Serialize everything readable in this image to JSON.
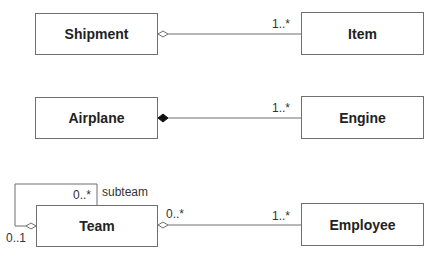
{
  "classes": {
    "shipment": "Shipment",
    "item": "Item",
    "airplane": "Airplane",
    "engine": "Engine",
    "team": "Team",
    "employee": "Employee"
  },
  "associations": [
    {
      "from": "Shipment",
      "to": "Item",
      "type": "aggregation",
      "target_multiplicity": "1..*"
    },
    {
      "from": "Airplane",
      "to": "Engine",
      "type": "composition",
      "target_multiplicity": "1..*"
    },
    {
      "from": "Team",
      "to": "Employee",
      "type": "aggregation",
      "source_multiplicity": "0..*",
      "target_multiplicity": "1..*"
    },
    {
      "from": "Team",
      "to": "Team",
      "type": "aggregation",
      "role": "subteam",
      "source_multiplicity": "0..1",
      "target_multiplicity": "0..*"
    }
  ],
  "labels": {
    "shipment_item_mult": "1..*",
    "airplane_engine_mult": "1..*",
    "team_employee_src_mult": "0..*",
    "team_employee_tgt_mult": "1..*",
    "subteam_role": "subteam",
    "subteam_mult": "0..*",
    "parent_mult": "0..1"
  },
  "colors": {
    "line": "#6f6f6f",
    "text": "#222222"
  }
}
